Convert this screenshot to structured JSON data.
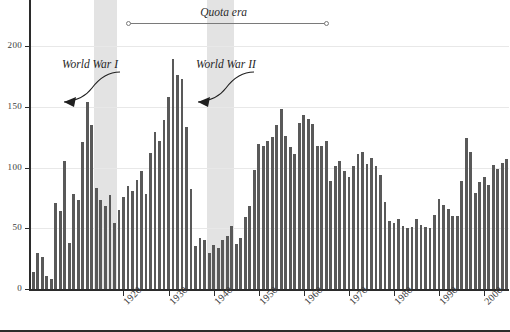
{
  "chart_data": {
    "type": "bar",
    "title": "",
    "subtitle": "",
    "xlabel": "",
    "ylabel": "",
    "xlim": [
      1899,
      2006
    ],
    "ylim": [
      0,
      220
    ],
    "grid": true,
    "legend_position": "none",
    "bar_color": "#595959",
    "band_color": "#e3e3e3",
    "y_ticks": [
      0,
      50,
      100,
      150,
      200
    ],
    "y_tick_labels": [
      "0",
      "50",
      "100",
      "150",
      "200"
    ],
    "x_ticks": [
      1920,
      1930,
      1940,
      1950,
      1960,
      1970,
      1980,
      1990,
      2000
    ],
    "x_tick_labels": [
      "1920",
      "1930",
      "1940",
      "1950",
      "1960",
      "1970",
      "1980",
      "1990",
      "2000"
    ],
    "x": [
      1900,
      1901,
      1902,
      1903,
      1904,
      1905,
      1906,
      1907,
      1908,
      1909,
      1910,
      1911,
      1912,
      1913,
      1914,
      1915,
      1916,
      1917,
      1918,
      1919,
      1920,
      1921,
      1922,
      1923,
      1924,
      1925,
      1926,
      1927,
      1928,
      1929,
      1930,
      1931,
      1932,
      1933,
      1934,
      1935,
      1936,
      1937,
      1938,
      1939,
      1940,
      1941,
      1942,
      1943,
      1944,
      1945,
      1946,
      1947,
      1948,
      1949,
      1950,
      1951,
      1952,
      1953,
      1954,
      1955,
      1956,
      1957,
      1958,
      1959,
      1960,
      1961,
      1962,
      1963,
      1964,
      1965,
      1966,
      1967,
      1968,
      1969,
      1970,
      1971,
      1972,
      1973,
      1974,
      1975,
      1976,
      1977,
      1978,
      1979,
      1980,
      1981,
      1982,
      1983,
      1984,
      1985,
      1986,
      1987,
      1988,
      1989,
      1990,
      1991,
      1992,
      1993,
      1994,
      1995,
      1996,
      1997,
      1998,
      1999,
      2000,
      2001,
      2002,
      2003,
      2004,
      2005
    ],
    "values": [
      14,
      30,
      26,
      11,
      8,
      71,
      64,
      105,
      38,
      78,
      73,
      121,
      154,
      135,
      83,
      73,
      68,
      77,
      54,
      65,
      76,
      85,
      81,
      90,
      97,
      78,
      112,
      129,
      122,
      139,
      158,
      189,
      176,
      173,
      133,
      82,
      35,
      42,
      40,
      30,
      36,
      34,
      40,
      44,
      52,
      37,
      42,
      59,
      68,
      98,
      119,
      118,
      122,
      125,
      135,
      148,
      126,
      117,
      111,
      137,
      143,
      140,
      136,
      118,
      118,
      122,
      89,
      101,
      105,
      97,
      92,
      101,
      111,
      113,
      103,
      108,
      101,
      94,
      72,
      56,
      54,
      58,
      52,
      50,
      51,
      58,
      53,
      51,
      50,
      61,
      74,
      69,
      66,
      60,
      60,
      89,
      124,
      113,
      79,
      88,
      92,
      86,
      102,
      99,
      104,
      107
    ],
    "annotations": [
      {
        "name": "quota-era",
        "text": "Quota era",
        "start_year": 1921,
        "end_year": 1965
      },
      {
        "name": "world-war-1",
        "text": "World War I",
        "band_start": 1914,
        "band_end": 1918
      },
      {
        "name": "world-war-2",
        "text": "World War II",
        "band_start": 1939,
        "band_end": 1945
      }
    ]
  },
  "labels": {
    "quota_era": "Quota era",
    "world_war_1": "World War I",
    "world_war_2": "World War II"
  }
}
